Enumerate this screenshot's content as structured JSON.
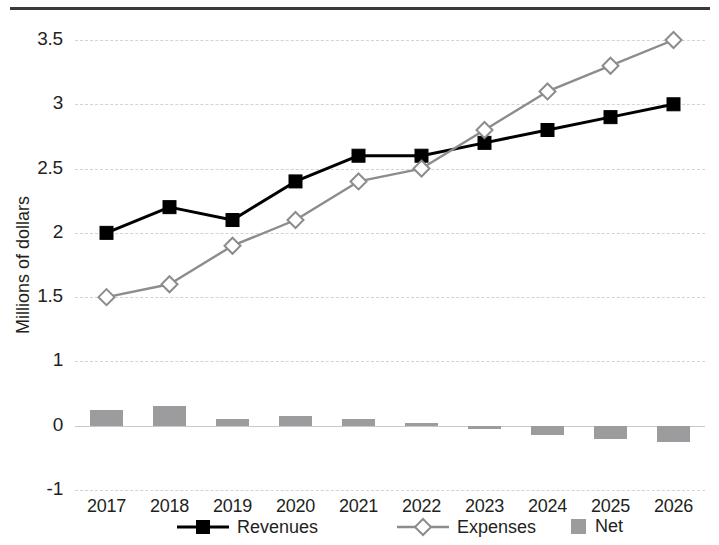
{
  "chart_data": {
    "type": "bar",
    "title": "",
    "subtitle": "",
    "xlabel": "",
    "ylabel": "Millions of dollars",
    "categories": [
      "2017",
      "2018",
      "2019",
      "2020",
      "2021",
      "2022",
      "2023",
      "2024",
      "2025",
      "2026"
    ],
    "y_ticks": [
      "3.5",
      "3",
      "2.5",
      "2",
      "1.5",
      "1",
      "0",
      "-1"
    ],
    "y_tick_values": [
      3.5,
      3,
      2.5,
      2,
      1.5,
      1,
      0,
      -1
    ],
    "ylim": [
      -1,
      3.5
    ],
    "grid": true,
    "legend_position": "bottom",
    "series": [
      {
        "name": "Revenues",
        "type": "line",
        "marker": "square-filled",
        "color": "#000000",
        "values": [
          2.0,
          2.2,
          2.1,
          2.4,
          2.6,
          2.6,
          2.7,
          2.8,
          2.9,
          3.0
        ]
      },
      {
        "name": "Expenses",
        "type": "line",
        "marker": "diamond-open",
        "color": "#8c8c8e",
        "values": [
          1.5,
          1.6,
          1.9,
          2.1,
          2.4,
          2.5,
          2.8,
          3.1,
          3.3,
          3.5
        ]
      },
      {
        "name": "Net",
        "type": "bar",
        "color": "#9c9c9e",
        "values": [
          0.25,
          0.3,
          0.1,
          0.15,
          0.1,
          0.05,
          -0.03,
          -0.15,
          -0.2,
          -0.25
        ]
      }
    ]
  },
  "legend": {
    "items": [
      {
        "label": "Revenues",
        "marker": "square-filled",
        "color": "#000000"
      },
      {
        "label": "Expenses",
        "marker": "diamond-open",
        "color": "#8c8c8e"
      },
      {
        "label": "Net",
        "marker": "bar-swatch",
        "color": "#9c9c9e"
      }
    ]
  },
  "axis": {
    "y_title": "Millions of dollars"
  }
}
